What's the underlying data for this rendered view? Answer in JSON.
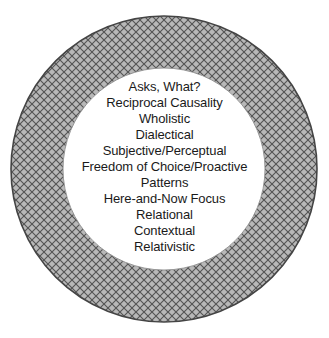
{
  "diagram": {
    "type": "annulus-text-list",
    "shape_name": "donut-circle",
    "geometry": {
      "center_x": 164,
      "center_y": 169,
      "outer_radius": 153,
      "inner_radius": 101,
      "ring_thickness": 52
    },
    "colors": {
      "ring_fill": "#b8b8b8",
      "ring_hatch_line": "#555555",
      "ring_outline": "#444444",
      "inner_fill": "#ffffff",
      "text": "#1a1a1a",
      "page_background": "#ffffff"
    },
    "ring_pattern": {
      "name": "diagonal-crosshatch",
      "spacing_px": 8,
      "angles_deg": [
        45,
        -45
      ]
    }
  },
  "content": {
    "attributes": [
      "Asks, What?",
      "Reciprocal Causality",
      "Wholistic",
      "Dialectical",
      "Subjective/Perceptual",
      "Freedom of Choice/Proactive",
      "Patterns",
      "Here-and-Now Focus",
      "Relational",
      "Contextual",
      "Relativistic"
    ]
  }
}
